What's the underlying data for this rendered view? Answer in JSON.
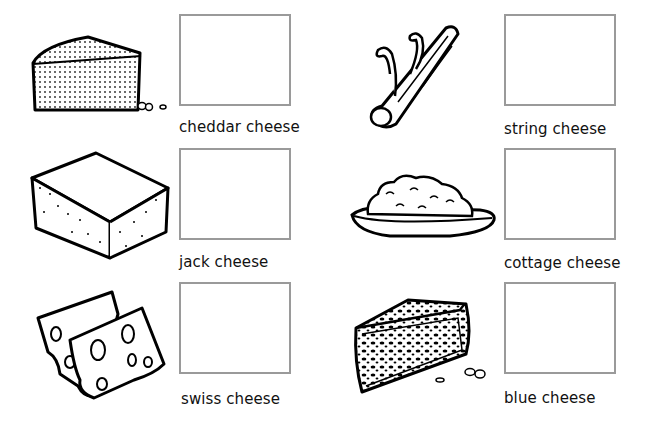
{
  "worksheet": {
    "items": [
      {
        "label": "cheddar cheese",
        "icon": "cheddar-wedge-icon"
      },
      {
        "label": "string cheese",
        "icon": "string-cheese-icon"
      },
      {
        "label": "jack cheese",
        "icon": "jack-block-icon"
      },
      {
        "label": "cottage cheese",
        "icon": "cottage-bowl-icon"
      },
      {
        "label": "swiss cheese",
        "icon": "swiss-slices-icon"
      },
      {
        "label": "blue cheese",
        "icon": "blue-wedge-icon"
      }
    ]
  }
}
